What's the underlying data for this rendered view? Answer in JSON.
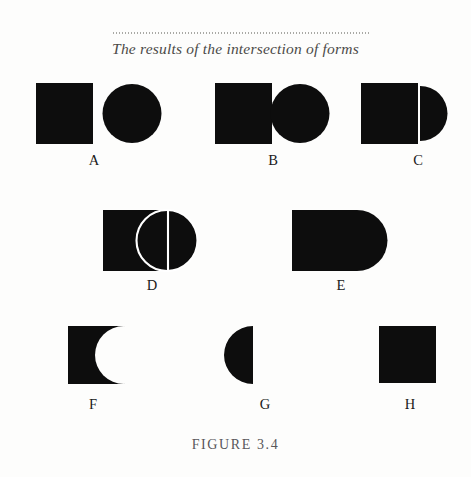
{
  "figure": {
    "title": "The results of the intersection of forms",
    "caption": "FIGURE 3.4",
    "ink_color": "#0d0d0d",
    "paper_color": "#fdfdfc",
    "rule_color": "#9a9a96"
  },
  "shapes": [
    {
      "label": "A",
      "name": "square-and-circle-separate",
      "description": "Separate square and circle, not touching"
    },
    {
      "label": "B",
      "name": "square-and-circle-touching",
      "description": "Square and circle touching at the edge"
    },
    {
      "label": "C",
      "name": "square-and-semicircle-joined",
      "description": "Square with semicircle attached at right, thin white seam"
    },
    {
      "label": "D",
      "name": "square-and-circle-overlapping-outlined",
      "description": "Square and circle overlapping, white outlines showing both forms"
    },
    {
      "label": "E",
      "name": "union-of-square-and-circle",
      "description": "Union: square with rounded right end, no seam"
    },
    {
      "label": "F",
      "name": "square-minus-circle",
      "description": "Subtraction: square with circular bite removed from right side"
    },
    {
      "label": "G",
      "name": "intersection-of-square-and-circle",
      "description": "Intersection: semicircle bulging left with flat right edge"
    },
    {
      "label": "H",
      "name": "plain-square",
      "description": "Plain square"
    }
  ]
}
